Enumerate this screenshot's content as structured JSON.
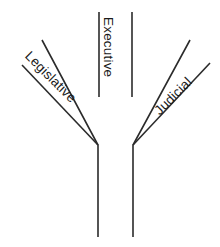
{
  "diagram": {
    "shape": "y-shaped-tree",
    "background_color": "#ffffff",
    "line_color": "#2b2b2b",
    "text_color": "#1a1a1a",
    "branches": [
      {
        "id": "legislative",
        "label": "Legislative",
        "orientation": "diagonal-left",
        "rotation_deg": 45
      },
      {
        "id": "executive",
        "label": "Executive",
        "orientation": "vertical-center",
        "rotation_deg": 90
      },
      {
        "id": "judicial",
        "label": "Judicial",
        "orientation": "diagonal-right",
        "rotation_deg": -45
      }
    ],
    "strokes": [
      {
        "id": "trunk-left",
        "points": "98,237 98,145 42,40"
      },
      {
        "id": "trunk-right",
        "points": "133,237 133,145 190,40"
      },
      {
        "id": "branch-left-outer",
        "points": "22,65 98,145"
      },
      {
        "id": "branch-right-outer",
        "points": "210,63 133,145"
      },
      {
        "id": "executive-left",
        "points": "99,12 99,97"
      },
      {
        "id": "executive-right",
        "points": "132,12 132,97"
      }
    ]
  }
}
